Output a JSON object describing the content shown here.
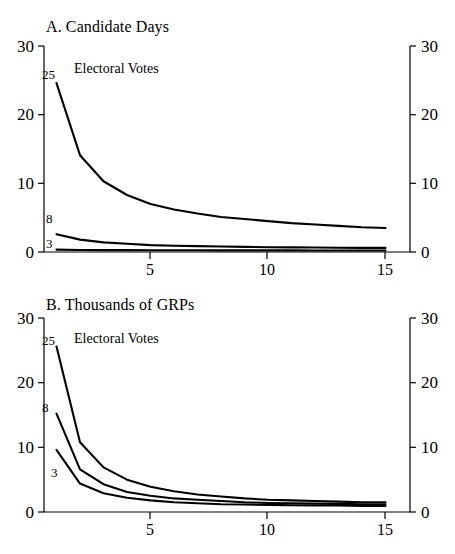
{
  "figure": {
    "background": "#ffffff",
    "ink": "#000000"
  },
  "chart_data": [
    {
      "type": "line",
      "panel": "A",
      "title": "A. Candidate Days",
      "legend_title": "Electoral Votes",
      "legend_position": "inside-top-left",
      "xlabel": "",
      "ylabel": "",
      "grid": false,
      "xlim": [
        1,
        15
      ],
      "ylim": [
        0,
        30
      ],
      "xticks": [
        5,
        10,
        15
      ],
      "xticklabels": [
        "5",
        "10",
        "15"
      ],
      "yticks": [
        0,
        10,
        20,
        30
      ],
      "yticklabels": [
        "0",
        "10",
        "20",
        "30"
      ],
      "right_axis_yticks": [
        0,
        10,
        20,
        30
      ],
      "right_axis_yticklabels": [
        "0",
        "10",
        "20",
        "30"
      ],
      "x": [
        1,
        2,
        3,
        4,
        5,
        6,
        7,
        8,
        9,
        10,
        11,
        12,
        13,
        14,
        15
      ],
      "series": [
        {
          "name": "25",
          "label": "25",
          "values": [
            24.6,
            14.1,
            10.3,
            8.3,
            7.0,
            6.2,
            5.6,
            5.1,
            4.8,
            4.5,
            4.2,
            4.0,
            3.8,
            3.6,
            3.5
          ]
        },
        {
          "name": "8",
          "label": "8",
          "values": [
            2.6,
            1.8,
            1.4,
            1.2,
            1.0,
            0.9,
            0.85,
            0.8,
            0.75,
            0.7,
            0.68,
            0.65,
            0.62,
            0.6,
            0.6
          ]
        },
        {
          "name": "3",
          "label": "3",
          "values": [
            0.35,
            0.3,
            0.28,
            0.27,
            0.26,
            0.25,
            0.25,
            0.24,
            0.24,
            0.23,
            0.23,
            0.22,
            0.22,
            0.22,
            0.22
          ]
        }
      ]
    },
    {
      "type": "line",
      "panel": "B",
      "title": "B. Thousands of GRPs",
      "legend_title": "Electoral Votes",
      "legend_position": "inside-top-left",
      "xlabel": "",
      "ylabel": "",
      "grid": false,
      "xlim": [
        1,
        15
      ],
      "ylim": [
        0,
        30
      ],
      "xticks": [
        5,
        10,
        15
      ],
      "xticklabels": [
        "5",
        "10",
        "15"
      ],
      "yticks": [
        0,
        10,
        20,
        30
      ],
      "yticklabels": [
        "0",
        "10",
        "20",
        "30"
      ],
      "right_axis_yticks": [
        0,
        10,
        20,
        30
      ],
      "right_axis_yticklabels": [
        "0",
        "10",
        "20",
        "30"
      ],
      "x": [
        1,
        2,
        3,
        4,
        5,
        6,
        7,
        8,
        9,
        10,
        11,
        12,
        13,
        14,
        15
      ],
      "series": [
        {
          "name": "25",
          "label": "25",
          "values": [
            25.6,
            10.8,
            6.9,
            5.0,
            3.9,
            3.2,
            2.7,
            2.4,
            2.1,
            1.9,
            1.8,
            1.7,
            1.6,
            1.5,
            1.5
          ]
        },
        {
          "name": "8",
          "label": "8",
          "values": [
            15.2,
            6.6,
            4.3,
            3.1,
            2.5,
            2.1,
            1.9,
            1.7,
            1.5,
            1.4,
            1.35,
            1.3,
            1.25,
            1.2,
            1.2
          ]
        },
        {
          "name": "3",
          "label": "3",
          "values": [
            9.6,
            4.4,
            2.9,
            2.2,
            1.8,
            1.5,
            1.35,
            1.2,
            1.15,
            1.1,
            1.05,
            1.0,
            1.0,
            0.95,
            0.95
          ]
        }
      ]
    }
  ],
  "panels": [
    {
      "id": "a",
      "title": "A. Candidate Days",
      "legend_title": "Electoral Votes",
      "series_labels": {
        "top": "25",
        "middle": "8",
        "bottom": "3"
      },
      "y_axis_left": [
        "30",
        "20",
        "10",
        "0"
      ],
      "y_axis_right": [
        "30",
        "20",
        "10",
        "0"
      ],
      "x_axis": [
        "5",
        "10",
        "15"
      ]
    },
    {
      "id": "b",
      "title": "B. Thousands of GRPs",
      "legend_title": "Electoral Votes",
      "series_labels": {
        "top": "25",
        "middle": "8",
        "bottom": "3"
      },
      "y_axis_left": [
        "30",
        "20",
        "10",
        "0"
      ],
      "y_axis_right": [
        "30",
        "20",
        "10",
        "0"
      ],
      "x_axis": [
        "5",
        "10",
        "15"
      ]
    }
  ]
}
